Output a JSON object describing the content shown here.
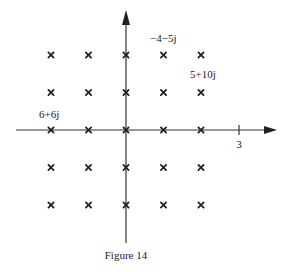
{
  "figure": {
    "caption": "Figure 14",
    "axes": {
      "x_tick_label": "3"
    },
    "lattice": {
      "columns": [
        -2,
        -1,
        0,
        1,
        2
      ],
      "rows": [
        2,
        1,
        0,
        -1,
        -2
      ]
    },
    "annotations": [
      {
        "text": "−4−5j",
        "near": [
          1,
          2
        ]
      },
      {
        "text": "5+10j",
        "near": [
          2,
          1
        ]
      },
      {
        "text": "6+6j",
        "near": [
          -2,
          0
        ]
      }
    ]
  }
}
